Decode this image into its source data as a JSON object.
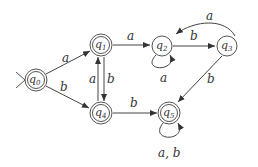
{
  "diagram": {
    "type": "DFA",
    "start_state": "q0",
    "states": [
      {
        "id": "q0",
        "label": "q",
        "sub": "0",
        "accepting": true
      },
      {
        "id": "q1",
        "label": "q",
        "sub": "1",
        "accepting": true
      },
      {
        "id": "q2",
        "label": "q",
        "sub": "2",
        "accepting": false
      },
      {
        "id": "q3",
        "label": "q",
        "sub": "3",
        "accepting": false
      },
      {
        "id": "q4",
        "label": "q",
        "sub": "4",
        "accepting": true
      },
      {
        "id": "q5",
        "label": "q",
        "sub": "5",
        "accepting": true
      }
    ],
    "transitions": [
      {
        "from": "q0",
        "to": "q1",
        "label": "a"
      },
      {
        "from": "q0",
        "to": "q4",
        "label": "b"
      },
      {
        "from": "q1",
        "to": "q2",
        "label": "a"
      },
      {
        "from": "q1",
        "to": "q4",
        "label": "b"
      },
      {
        "from": "q4",
        "to": "q1",
        "label": "a"
      },
      {
        "from": "q4",
        "to": "q5",
        "label": "b"
      },
      {
        "from": "q2",
        "to": "q2",
        "label": "a"
      },
      {
        "from": "q2",
        "to": "q3",
        "label": "b"
      },
      {
        "from": "q3",
        "to": "q2",
        "label": "a"
      },
      {
        "from": "q3",
        "to": "q5",
        "label": "b"
      },
      {
        "from": "q5",
        "to": "q5",
        "label": "a, b"
      }
    ]
  }
}
